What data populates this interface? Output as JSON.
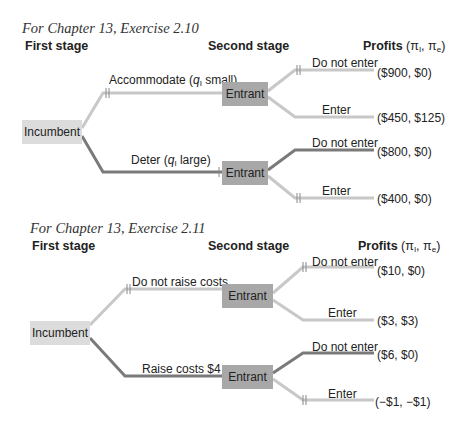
{
  "colors": {
    "light_branch": "#c8c8c8",
    "dark_branch": "#7a7a7a",
    "incumbent_fill": "#dcdcdc",
    "entrant_fill": "#a8a8a8"
  },
  "trees": [
    {
      "title": "For Chapter 13, Exercise 2.10",
      "first_stage": "First stage",
      "second_stage": "Second stage",
      "profits_label": "Profits",
      "profits_symbols": "(π",
      "profits_sub_i": "I",
      "profits_mid": ", π",
      "profits_sub_e": "e",
      "profits_close": ")",
      "root": "Incumbent",
      "upper_action": {
        "pre": "Accommodate (",
        "var": "q",
        "sub": "I",
        "post": " small)"
      },
      "lower_action": {
        "pre": "Deter (",
        "var": "q",
        "sub": "I",
        "post": " large)"
      },
      "upper_node": "Entrant",
      "lower_node": "Entrant",
      "outcomes": [
        {
          "action": "Do not enter",
          "payoff": "($900, $0)"
        },
        {
          "action": "Enter",
          "payoff": "($450, $125)"
        },
        {
          "action": "Do not enter",
          "payoff": "($800, $0)"
        },
        {
          "action": "Enter",
          "payoff": "($400, $0)"
        }
      ]
    },
    {
      "title": "For Chapter 13, Exercise 2.11",
      "first_stage": "First stage",
      "second_stage": "Second stage",
      "profits_label": "Profits",
      "profits_symbols": "(π",
      "profits_sub_i": "I",
      "profits_mid": ", π",
      "profits_sub_e": "e",
      "profits_close": ")",
      "root": "Incumbent",
      "upper_action": "Do not raise costs",
      "lower_action": "Raise costs $4",
      "upper_node": "Entrant",
      "lower_node": "Entrant",
      "outcomes": [
        {
          "action": "Do not enter",
          "payoff": "($10, $0)"
        },
        {
          "action": "Enter",
          "payoff": "($3, $3)"
        },
        {
          "action": "Do not enter",
          "payoff": "($6, $0)"
        },
        {
          "action": "Enter",
          "payoff": "(−$1, −$1)"
        }
      ]
    }
  ]
}
